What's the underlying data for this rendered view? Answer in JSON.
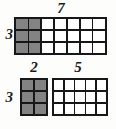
{
  "figure": {
    "kind": "area-model-diagram",
    "background_color": "#fdfdfc",
    "line_color": "#171717",
    "shaded_color": "#838383",
    "unshaded_color": "#ffffff"
  },
  "labels": {
    "top_whole_width": "7",
    "top_height": "3",
    "part_a_width": "2",
    "part_b_width": "5",
    "bottom_height": "3"
  },
  "chart_data": {
    "type": "table",
    "title": "",
    "rectangles": [
      {
        "name": "whole",
        "rows": 3,
        "cols": 7,
        "width_label": "7",
        "height_label": "3",
        "shaded_cols": 2,
        "unshaded_cols": 5,
        "area": 21
      },
      {
        "name": "part-a",
        "rows": 3,
        "cols": 2,
        "width_label": "2",
        "height_label": "3",
        "shaded_cols": 2,
        "unshaded_cols": 0,
        "area": 6
      },
      {
        "name": "part-b",
        "rows": 3,
        "cols": 5,
        "width_label": "5",
        "height_label": "",
        "shaded_cols": 0,
        "unshaded_cols": 5,
        "area": 15
      }
    ]
  }
}
